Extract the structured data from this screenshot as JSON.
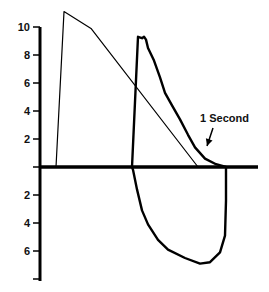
{
  "chart_data": {
    "type": "line",
    "title": "",
    "xlabel": "",
    "ylabel": "",
    "xlim": [
      0,
      22
    ],
    "ylim": [
      -9,
      11.5
    ],
    "grid": false,
    "legend": "none",
    "y_ticks": [
      {
        "value": 10,
        "label": "10"
      },
      {
        "value": 8,
        "label": "8"
      },
      {
        "value": 6,
        "label": "6"
      },
      {
        "value": 4,
        "label": "4"
      },
      {
        "value": 2,
        "label": "2"
      },
      {
        "value": -2,
        "label": "2"
      },
      {
        "value": -4,
        "label": "4"
      },
      {
        "value": -6,
        "label": "6"
      },
      {
        "value": -8,
        "label": ""
      }
    ],
    "series": [
      {
        "name": "reference-expiratory-curve",
        "style": "thin",
        "points": [
          [
            1.6,
            0
          ],
          [
            2.4,
            11.1
          ],
          [
            5.1,
            9.9
          ],
          [
            15.8,
            0
          ]
        ]
      },
      {
        "name": "flow-volume-loop",
        "style": "thick",
        "closed": true,
        "points": [
          [
            9.2,
            0
          ],
          [
            9.8,
            9.3
          ],
          [
            10.2,
            9.2
          ],
          [
            10.4,
            9.3
          ],
          [
            10.6,
            9.1
          ],
          [
            10.8,
            8.5
          ],
          [
            11.4,
            7.6
          ],
          [
            12.0,
            6.4
          ],
          [
            12.5,
            5.3
          ],
          [
            13.2,
            4.4
          ],
          [
            14.0,
            3.4
          ],
          [
            14.8,
            2.3
          ],
          [
            15.5,
            1.4
          ],
          [
            16.5,
            0.6
          ],
          [
            17.6,
            0.2
          ],
          [
            18.6,
            0
          ],
          [
            18.6,
            -2.4
          ],
          [
            18.5,
            -4.9
          ],
          [
            18.0,
            -6.1
          ],
          [
            17.0,
            -6.8
          ],
          [
            16.0,
            -6.9
          ],
          [
            14.5,
            -6.5
          ],
          [
            12.8,
            -5.9
          ],
          [
            11.8,
            -5.2
          ],
          [
            10.8,
            -4.1
          ],
          [
            10.2,
            -3.1
          ],
          [
            9.7,
            -1.6
          ],
          [
            9.3,
            -0.2
          ]
        ]
      }
    ],
    "annotations": [
      {
        "text": "1 Second",
        "x": 16.0,
        "y": 3.5,
        "arrow_to": [
          16.7,
          1.5
        ]
      }
    ],
    "markers": [
      {
        "name": "one-second-tick",
        "x": 18.6,
        "y_from": 0,
        "y_to": -1
      }
    ]
  }
}
